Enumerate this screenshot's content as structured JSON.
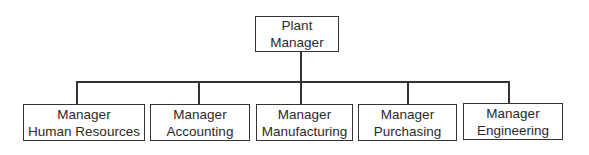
{
  "chart": {
    "root": {
      "line1": "Plant",
      "line2": "Manager"
    },
    "children": [
      {
        "line1": "Manager",
        "line2": "Human Resources"
      },
      {
        "line1": "Manager",
        "line2": "Accounting"
      },
      {
        "line1": "Manager",
        "line2": "Manufacturing"
      },
      {
        "line1": "Manager",
        "line2": "Purchasing"
      },
      {
        "line1": "Manager",
        "line2": "Engineering"
      }
    ]
  }
}
